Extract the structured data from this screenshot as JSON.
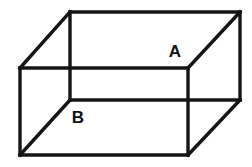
{
  "figure": {
    "kind": "wireframe-cuboid-diagram",
    "background_color": "#ffffff",
    "line_color": "#151515",
    "line_width": 3.4,
    "canvas": {
      "width": 252,
      "height": 167
    }
  },
  "geometry": {
    "back_face": {
      "name": "back-face",
      "top_left": {
        "x": 70,
        "y": 12
      },
      "top_right": {
        "x": 240,
        "y": 12
      },
      "bottom_right": {
        "x": 240,
        "y": 100
      },
      "bottom_left": {
        "x": 70,
        "y": 100
      }
    },
    "front_face": {
      "name": "front-face",
      "top_left": {
        "x": 20,
        "y": 68
      },
      "top_right": {
        "x": 188,
        "y": 68
      },
      "bottom_right": {
        "x": 188,
        "y": 155
      },
      "bottom_left": {
        "x": 20,
        "y": 155
      }
    },
    "depth_offset": {
      "dx": -50,
      "dy": 56
    }
  },
  "edges": [
    {
      "name": "back-top-edge",
      "path": "M 70 12 L 240 12"
    },
    {
      "name": "back-right-edge",
      "path": "M 240 12 L 240 100"
    },
    {
      "name": "back-bottom-edge",
      "path": "M 240 100 L 70 100"
    },
    {
      "name": "back-left-edge",
      "path": "M 70 100 L 70 12"
    },
    {
      "name": "front-top-edge",
      "path": "M 20 68 L 188 68"
    },
    {
      "name": "front-right-edge",
      "path": "M 188 68 L 188 155"
    },
    {
      "name": "front-bottom-edge",
      "path": "M 188 155 L 20 155"
    },
    {
      "name": "front-left-edge",
      "path": "M 20 155 L 20 68"
    },
    {
      "name": "connector-top-left",
      "path": "M 20 68 L 70 12"
    },
    {
      "name": "connector-top-right",
      "path": "M 188 68 L 240 12"
    },
    {
      "name": "connector-bottom-right",
      "path": "M 188 155 L 240 100"
    },
    {
      "name": "connector-bottom-left",
      "path": "M 20 155 L 70 100"
    }
  ],
  "labels": {
    "a": {
      "text": "A",
      "x": 175,
      "y": 57
    },
    "b": {
      "text": "B",
      "x": 78,
      "y": 123
    }
  }
}
